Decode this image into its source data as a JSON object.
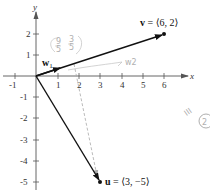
{
  "figure": {
    "axes": {
      "x_label": "x",
      "y_label": "y",
      "x_ticks": [
        "-1",
        "1",
        "2",
        "3",
        "4",
        "5",
        "6"
      ],
      "y_ticks": [
        "2",
        "1",
        "-1",
        "-2",
        "-3",
        "-4",
        "-5"
      ],
      "x_tick_values": [
        -1,
        1,
        2,
        3,
        4,
        5,
        6
      ],
      "y_tick_values": [
        2,
        1,
        -1,
        -2,
        -3,
        -4,
        -5
      ]
    },
    "vectors": {
      "v": {
        "name": "v",
        "equals": " = ⟨6, 2⟩",
        "x": 6,
        "y": 2
      },
      "u": {
        "name": "u",
        "equals": " = ⟨3, −5⟩",
        "x": 3,
        "y": -5
      },
      "w1": {
        "name": "w",
        "subscript": "1"
      }
    },
    "handwriting": {
      "fraction_note": "(9/5, 3/5)",
      "fraction_num_1": "9",
      "fraction_den_1": "5",
      "fraction_num_2": "3",
      "fraction_den_2": "5",
      "w2_note": "w2",
      "margin_note": "III",
      "circled": "2"
    },
    "colors": {
      "vector": "#111111",
      "axis": "#555555",
      "handwriting": "#b8b8b8",
      "dashed": "#aaaaaa"
    }
  }
}
